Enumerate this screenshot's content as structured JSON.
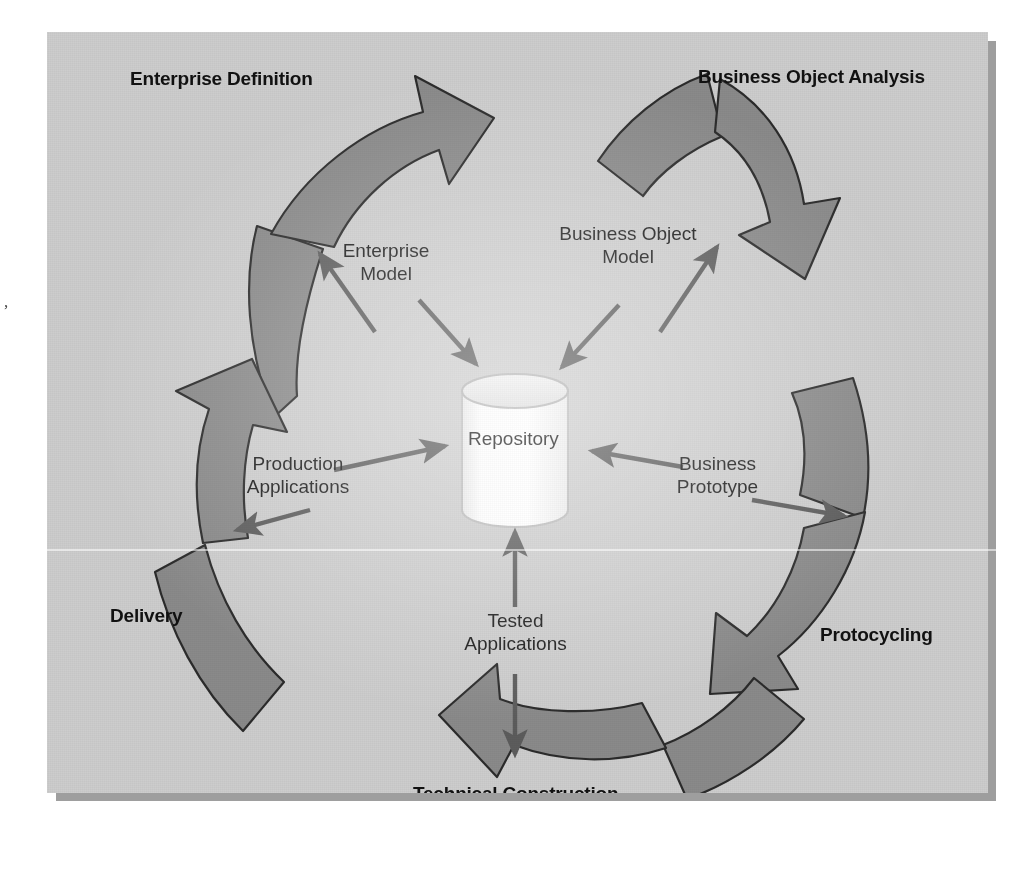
{
  "diagram": {
    "type": "cycle-diagram",
    "title_visible": false,
    "center": {
      "shape": "cylinder",
      "label": "Repository"
    },
    "colors": {
      "background": "#cdcdcd",
      "swirl_fill": "#8a8a8a",
      "swirl_stroke": "#2b2b2b",
      "arrow": "#5c5c5c",
      "text": "#111111",
      "cylinder_fill": "#fbfbfb",
      "cylinder_stroke": "#b9b9b9",
      "panel_shadow": "#9e9e9e"
    },
    "stages": [
      {
        "id": "enterprise-definition",
        "label": "Enterprise Definition"
      },
      {
        "id": "business-object-analysis",
        "label": "Business Object Analysis"
      },
      {
        "id": "protocycling",
        "label": "Protocycling"
      },
      {
        "id": "technical-construction",
        "label": "Technical Construction"
      },
      {
        "id": "delivery",
        "label": "Delivery"
      }
    ],
    "flows": [
      {
        "id": "enterprise-model",
        "line1": "Enterprise",
        "line2": "Model"
      },
      {
        "id": "business-object-model",
        "line1": "Business Object",
        "line2": "Model"
      },
      {
        "id": "business-prototype",
        "line1": "Business",
        "line2": "Prototype"
      },
      {
        "id": "tested-applications",
        "line1": "Tested",
        "line2": "Applications"
      },
      {
        "id": "production-applications",
        "line1": "Production",
        "line2": "Applications"
      }
    ],
    "artifacts": {
      "edge_speck": ","
    }
  }
}
